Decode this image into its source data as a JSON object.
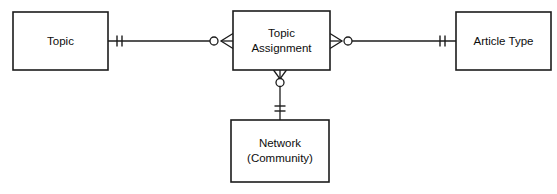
{
  "diagram": {
    "type": "entity-relationship-diagram",
    "notation": "crows-foot",
    "title": "",
    "background_color": "#ffffff",
    "line_color": "#1c1c1c",
    "text_color": "#0d0d0d",
    "width": 557,
    "height": 194
  },
  "entities": [
    {
      "id": "topic",
      "label_lines": [
        "Topic"
      ],
      "line1": "Topic",
      "line2": "",
      "x": 13,
      "y": 12,
      "width": 95,
      "height": 58
    },
    {
      "id": "topic-assignment",
      "label_lines": [
        "Topic",
        "Assignment"
      ],
      "line1": "Topic",
      "line2": "Assignment",
      "x": 233,
      "y": 11,
      "width": 97,
      "height": 59
    },
    {
      "id": "article-type",
      "label_lines": [
        "Article Type"
      ],
      "line1": "Article Type",
      "line2": "",
      "x": 456,
      "y": 12,
      "width": 95,
      "height": 58
    },
    {
      "id": "network-community",
      "label_lines": [
        "Network",
        "(Community)"
      ],
      "line1": "Network",
      "line2": "(Community)",
      "x": 231,
      "y": 120,
      "width": 98,
      "height": 62
    }
  ],
  "relationships": [
    {
      "id": "topic-to-topic-assignment",
      "from": "topic",
      "to": "topic-assignment",
      "orientation": "horizontal",
      "from_cardinality": "one-and-only-one",
      "from_cardinality_symbol": "double-tick",
      "to_cardinality": "zero-or-many",
      "to_cardinality_symbol": "circle-crowsfoot"
    },
    {
      "id": "topic-assignment-to-article-type",
      "from": "topic-assignment",
      "to": "article-type",
      "orientation": "horizontal",
      "from_cardinality": "zero-or-many",
      "from_cardinality_symbol": "circle-crowsfoot",
      "to_cardinality": "one-and-only-one",
      "to_cardinality_symbol": "double-tick"
    },
    {
      "id": "topic-assignment-to-network",
      "from": "topic-assignment",
      "to": "network-community",
      "orientation": "vertical",
      "from_cardinality": "zero-or-many",
      "from_cardinality_symbol": "circle-crowsfoot",
      "to_cardinality": "one-and-only-one",
      "to_cardinality_symbol": "double-tick"
    }
  ]
}
